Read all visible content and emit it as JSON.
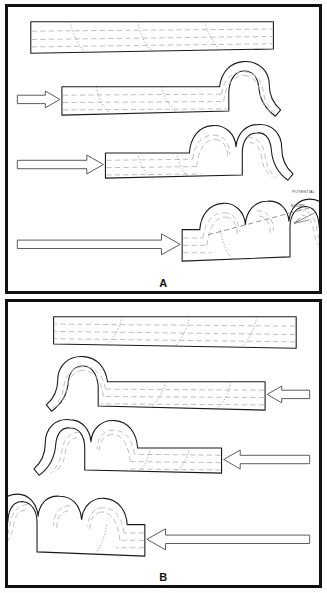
{
  "figure": {
    "background_color": "#ffffff",
    "border_color": "#111111"
  },
  "panels": [
    {
      "id": "A",
      "label": "A",
      "compression_direction": "left-to-right",
      "annotations": [
        {
          "id": "potential",
          "text": "POTENTIAL"
        },
        {
          "id": "slump",
          "text": "SLUMP"
        }
      ],
      "stages": [
        {
          "index": 1,
          "name": "undeformed-slab",
          "arrow": false,
          "lobes": 0
        },
        {
          "index": 2,
          "name": "initial-buckle",
          "arrow": true,
          "arrow_length": "short",
          "lobes": 1
        },
        {
          "index": 3,
          "name": "second-fold",
          "arrow": true,
          "arrow_length": "medium",
          "lobes": 2
        },
        {
          "index": 4,
          "name": "stacked-folds",
          "arrow": true,
          "arrow_length": "long",
          "lobes": 3
        }
      ]
    },
    {
      "id": "B",
      "label": "B",
      "compression_direction": "right-to-left",
      "annotations": [],
      "stages": [
        {
          "index": 1,
          "name": "undeformed-slab",
          "arrow": false,
          "lobes": 0
        },
        {
          "index": 2,
          "name": "initial-buckle",
          "arrow": true,
          "arrow_length": "short",
          "lobes": 1
        },
        {
          "index": 3,
          "name": "second-fold",
          "arrow": true,
          "arrow_length": "medium",
          "lobes": 2
        },
        {
          "index": 4,
          "name": "stacked-folds",
          "arrow": true,
          "arrow_length": "long",
          "lobes": 3
        }
      ]
    }
  ],
  "style": {
    "outline_color": "#1a1a1a",
    "bedding_line_color": "#b9b2b2",
    "joint_line_color": "#8d8d8d",
    "slab_fill": "#ffffff",
    "arrow_fill": "#ffffff",
    "arrow_stroke": "#5a5a5a"
  }
}
